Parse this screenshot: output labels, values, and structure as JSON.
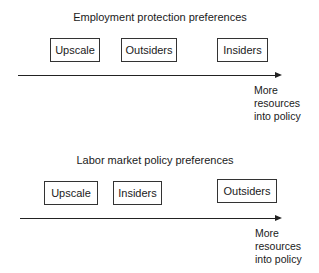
{
  "panels": [
    {
      "title": "Employment protection preferences",
      "boxes": [
        {
          "label": "Upscale"
        },
        {
          "label": "Outsiders"
        },
        {
          "label": "Insiders"
        }
      ],
      "axis_note": [
        "More",
        "resources",
        "into policy"
      ]
    },
    {
      "title": "Labor market policy preferences",
      "boxes": [
        {
          "label": "Upscale"
        },
        {
          "label": "Insiders"
        },
        {
          "label": "Outsiders"
        }
      ],
      "axis_note": [
        "More",
        "resources",
        "into policy"
      ]
    }
  ]
}
